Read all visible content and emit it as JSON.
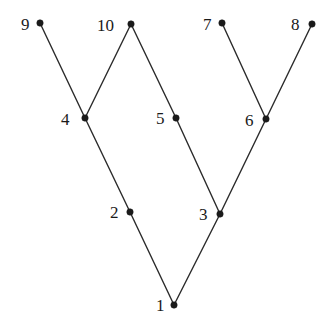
{
  "figure": {
    "title": "",
    "background_color": "#ffffff",
    "node_color": "#1a1a1a",
    "edge_color": "#2b2b2b",
    "label_color": "#1a1a1a",
    "width": 332,
    "height": 326
  },
  "chart_data": {
    "type": "diagram",
    "subtype": "node-link-graph",
    "title": "",
    "xlabel": "",
    "ylabel": "",
    "grid": false,
    "legend": null,
    "xlim": [
      0,
      332
    ],
    "ylim": [
      0,
      326
    ],
    "nodes": [
      {
        "id": "1",
        "label": "1",
        "x": 174,
        "y": 305,
        "label_x": 156,
        "label_y": 297
      },
      {
        "id": "2",
        "label": "2",
        "x": 130,
        "y": 212,
        "label_x": 110,
        "label_y": 204
      },
      {
        "id": "3",
        "label": "3",
        "x": 220,
        "y": 214,
        "label_x": 199,
        "label_y": 206
      },
      {
        "id": "4",
        "label": "4",
        "x": 85,
        "y": 118,
        "label_x": 61,
        "label_y": 111
      },
      {
        "id": "5",
        "label": "5",
        "x": 176,
        "y": 118,
        "label_x": 156,
        "label_y": 110
      },
      {
        "id": "6",
        "label": "6",
        "x": 266,
        "y": 119,
        "label_x": 245,
        "label_y": 112
      },
      {
        "id": "7",
        "label": "7",
        "x": 222,
        "y": 23,
        "label_x": 203,
        "label_y": 16
      },
      {
        "id": "8",
        "label": "8",
        "x": 312,
        "y": 24,
        "label_x": 291,
        "label_y": 16
      },
      {
        "id": "9",
        "label": "9",
        "x": 40,
        "y": 23,
        "label_x": 21,
        "label_y": 16
      },
      {
        "id": "10",
        "label": "10",
        "x": 131,
        "y": 24,
        "label_x": 97,
        "label_y": 17
      }
    ],
    "edges": [
      {
        "source": "9",
        "target": "4"
      },
      {
        "source": "10",
        "target": "4"
      },
      {
        "source": "10",
        "target": "5"
      },
      {
        "source": "5",
        "target": "3"
      },
      {
        "source": "4",
        "target": "2"
      },
      {
        "source": "2",
        "target": "1"
      },
      {
        "source": "1",
        "target": "3"
      },
      {
        "source": "3",
        "target": "6"
      },
      {
        "source": "6",
        "target": "7"
      },
      {
        "source": "6",
        "target": "8"
      }
    ]
  }
}
